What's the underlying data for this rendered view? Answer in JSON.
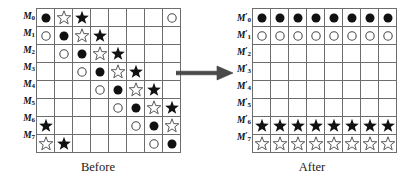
{
  "figure": {
    "arrow_icon": "right-arrow-icon",
    "symbol_legend": {
      "filled_circle": "filled-circle-icon",
      "open_circle": "open-circle-icon",
      "filled_star": "filled-star-icon",
      "open_star": "open-star-icon",
      "empty": "empty-cell"
    }
  },
  "before": {
    "caption": "Before",
    "row_labels": [
      "M",
      "M",
      "M",
      "M",
      "M",
      "M",
      "M",
      "M"
    ],
    "row_label_subscripts": [
      "0",
      "1",
      "2",
      "3",
      "4",
      "5",
      "6",
      "7"
    ],
    "row_label_prime": false,
    "columns": 8,
    "rows": 8,
    "cells": [
      [
        "filled_circle",
        "open_star",
        "filled_star",
        "empty",
        "empty",
        "empty",
        "empty",
        "open_circle"
      ],
      [
        "open_circle",
        "filled_circle",
        "open_star",
        "filled_star",
        "empty",
        "empty",
        "empty",
        "empty"
      ],
      [
        "empty",
        "open_circle",
        "filled_circle",
        "open_star",
        "filled_star",
        "empty",
        "empty",
        "empty"
      ],
      [
        "empty",
        "empty",
        "open_circle",
        "filled_circle",
        "open_star",
        "filled_star",
        "empty",
        "empty"
      ],
      [
        "empty",
        "empty",
        "empty",
        "open_circle",
        "filled_circle",
        "open_star",
        "filled_star",
        "empty"
      ],
      [
        "empty",
        "empty",
        "empty",
        "empty",
        "open_circle",
        "filled_circle",
        "open_star",
        "filled_star"
      ],
      [
        "filled_star",
        "empty",
        "empty",
        "empty",
        "empty",
        "open_circle",
        "filled_circle",
        "open_star"
      ],
      [
        "open_star",
        "filled_star",
        "empty",
        "empty",
        "empty",
        "empty",
        "open_circle",
        "filled_circle"
      ]
    ]
  },
  "after": {
    "caption": "After",
    "row_labels": [
      "M",
      "M",
      "M",
      "M",
      "M",
      "M",
      "M",
      "M"
    ],
    "row_label_subscripts": [
      "0",
      "1",
      "2",
      "3",
      "4",
      "5",
      "6",
      "7"
    ],
    "row_label_prime": true,
    "columns": 8,
    "rows": 8,
    "cells": [
      [
        "filled_circle",
        "filled_circle",
        "filled_circle",
        "filled_circle",
        "filled_circle",
        "filled_circle",
        "filled_circle",
        "filled_circle"
      ],
      [
        "open_circle",
        "open_circle",
        "open_circle",
        "open_circle",
        "open_circle",
        "open_circle",
        "open_circle",
        "open_circle"
      ],
      [
        "empty",
        "empty",
        "empty",
        "empty",
        "empty",
        "empty",
        "empty",
        "empty"
      ],
      [
        "empty",
        "empty",
        "empty",
        "empty",
        "empty",
        "empty",
        "empty",
        "empty"
      ],
      [
        "empty",
        "empty",
        "empty",
        "empty",
        "empty",
        "empty",
        "empty",
        "empty"
      ],
      [
        "empty",
        "empty",
        "empty",
        "empty",
        "empty",
        "empty",
        "empty",
        "empty"
      ],
      [
        "filled_star",
        "filled_star",
        "filled_star",
        "filled_star",
        "filled_star",
        "filled_star",
        "filled_star",
        "filled_star"
      ],
      [
        "open_star",
        "open_star",
        "open_star",
        "open_star",
        "open_star",
        "open_star",
        "open_star",
        "open_star"
      ]
    ]
  }
}
